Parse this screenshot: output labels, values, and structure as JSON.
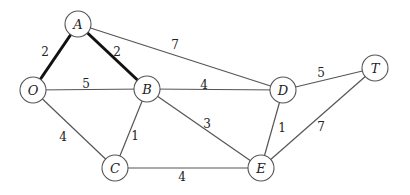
{
  "diagram": {
    "type": "weighted-undirected-graph",
    "node_radius": 13,
    "nodes": [
      {
        "id": "A",
        "label": "A",
        "x": 78,
        "y": 24
      },
      {
        "id": "O",
        "label": "O",
        "x": 33,
        "y": 90
      },
      {
        "id": "B",
        "label": "B",
        "x": 147,
        "y": 89
      },
      {
        "id": "D",
        "label": "D",
        "x": 283,
        "y": 90
      },
      {
        "id": "T",
        "label": "T",
        "x": 375,
        "y": 68
      },
      {
        "id": "C",
        "label": "C",
        "x": 115,
        "y": 168
      },
      {
        "id": "E",
        "label": "E",
        "x": 261,
        "y": 168
      }
    ],
    "edges": [
      {
        "from": "A",
        "to": "O",
        "weight": "2",
        "bold": true,
        "lx": 45,
        "ly": 56
      },
      {
        "from": "A",
        "to": "B",
        "weight": "2",
        "bold": true,
        "lx": 117,
        "ly": 56
      },
      {
        "from": "A",
        "to": "D",
        "weight": "7",
        "bold": false,
        "lx": 175,
        "ly": 49
      },
      {
        "from": "O",
        "to": "B",
        "weight": "5",
        "bold": false,
        "lx": 86,
        "ly": 88
      },
      {
        "from": "B",
        "to": "D",
        "weight": "4",
        "bold": false,
        "lx": 204,
        "ly": 89
      },
      {
        "from": "D",
        "to": "T",
        "weight": "5",
        "bold": false,
        "lx": 321,
        "ly": 77
      },
      {
        "from": "O",
        "to": "C",
        "weight": "4",
        "bold": false,
        "lx": 63,
        "ly": 141
      },
      {
        "from": "B",
        "to": "C",
        "weight": "1",
        "bold": false,
        "lx": 135,
        "ly": 140
      },
      {
        "from": "B",
        "to": "E",
        "weight": "3",
        "bold": false,
        "lx": 207,
        "ly": 128
      },
      {
        "from": "D",
        "to": "E",
        "weight": "1",
        "bold": false,
        "lx": 282,
        "ly": 132
      },
      {
        "from": "T",
        "to": "E",
        "weight": "7",
        "bold": false,
        "lx": 321,
        "ly": 131
      },
      {
        "from": "C",
        "to": "E",
        "weight": "4",
        "bold": false,
        "lx": 182,
        "ly": 181
      }
    ],
    "colors": {
      "edge": "#555555",
      "bold_edge": "#111111",
      "node_stroke": "#555555",
      "background": "#ffffff"
    }
  }
}
